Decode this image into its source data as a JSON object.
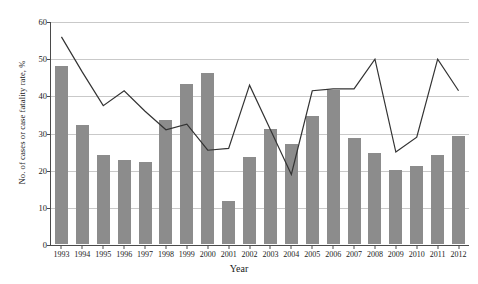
{
  "chart_data": {
    "type": "bar",
    "title": "",
    "xlabel": "Year",
    "ylabel": "No. of cases or case fatality rate, %",
    "categories": [
      "1993",
      "1994",
      "1995",
      "1996",
      "1997",
      "1998",
      "1999",
      "2000",
      "2001",
      "2002",
      "2003",
      "2004",
      "2005",
      "2006",
      "2007",
      "2008",
      "2009",
      "2010",
      "2011",
      "2012"
    ],
    "ylim": [
      0,
      60
    ],
    "yticks": [
      0,
      10,
      20,
      30,
      40,
      50,
      60
    ],
    "grid": true,
    "legend": "none",
    "series": [
      {
        "name": "No. of cases",
        "type": "bar",
        "color": "#8c8c8c",
        "values": [
          48,
          32,
          24,
          22.5,
          22,
          33.5,
          43,
          46,
          11.5,
          23.5,
          31,
          27,
          34.5,
          41.5,
          28.5,
          24.5,
          20,
          21,
          24,
          29
        ]
      },
      {
        "name": "Case fatality rate, %",
        "type": "line",
        "color": "#333333",
        "values": [
          56,
          46.5,
          37.5,
          41.5,
          36,
          31,
          32.5,
          25.5,
          26,
          43,
          31,
          19,
          41.5,
          42,
          42,
          50,
          25,
          29,
          50,
          41.5
        ]
      }
    ]
  }
}
